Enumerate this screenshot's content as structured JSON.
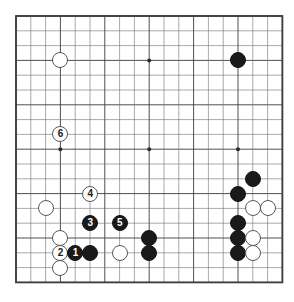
{
  "diagram": {
    "kind": "go-board-diagram",
    "board_size": 19,
    "colors": {
      "background": "#ffffff",
      "grid_line": "#6e6e6e",
      "grid_line_bold": "#3c3c3c",
      "board_border": "#3c3c3c",
      "star_point": "#2b2b2b",
      "black_stone": "#1a1a1a",
      "white_stone": "#ffffff",
      "white_stone_edge": "#585858",
      "black_label_text": "#ffffff",
      "white_label_text": "#1a1a1a"
    },
    "geometry": {
      "origin_x": 16,
      "origin_y": 16,
      "spacing": 14.8,
      "stone_diameter": 16,
      "star_point_radius": 2
    },
    "star_points": [
      {
        "col": 3,
        "row": 3
      },
      {
        "col": 9,
        "row": 3
      },
      {
        "col": 15,
        "row": 3
      },
      {
        "col": 3,
        "row": 9
      },
      {
        "col": 9,
        "row": 9
      },
      {
        "col": 15,
        "row": 9
      },
      {
        "col": 3,
        "row": 15
      },
      {
        "col": 9,
        "row": 15
      },
      {
        "col": 15,
        "row": 15
      }
    ],
    "stones": [
      {
        "color": "white",
        "col": 3,
        "row": 3,
        "label": ""
      },
      {
        "color": "black",
        "col": 15,
        "row": 3,
        "label": ""
      },
      {
        "color": "white",
        "col": 3,
        "row": 8,
        "label": "6"
      },
      {
        "color": "black",
        "col": 16,
        "row": 11,
        "label": ""
      },
      {
        "color": "white",
        "col": 5,
        "row": 12,
        "label": "4"
      },
      {
        "color": "black",
        "col": 15,
        "row": 12,
        "label": ""
      },
      {
        "color": "white",
        "col": 2,
        "row": 13,
        "label": ""
      },
      {
        "color": "white",
        "col": 16,
        "row": 13,
        "label": ""
      },
      {
        "color": "white",
        "col": 17,
        "row": 13,
        "label": ""
      },
      {
        "color": "black",
        "col": 5,
        "row": 14,
        "label": "3"
      },
      {
        "color": "black",
        "col": 7,
        "row": 14,
        "label": "5"
      },
      {
        "color": "black",
        "col": 15,
        "row": 14,
        "label": ""
      },
      {
        "color": "white",
        "col": 3,
        "row": 15,
        "label": ""
      },
      {
        "color": "black",
        "col": 9,
        "row": 15,
        "label": ""
      },
      {
        "color": "black",
        "col": 15,
        "row": 15,
        "label": ""
      },
      {
        "color": "white",
        "col": 16,
        "row": 15,
        "label": ""
      },
      {
        "color": "white",
        "col": 3,
        "row": 16,
        "label": "2"
      },
      {
        "color": "black",
        "col": 4,
        "row": 16,
        "label": "1"
      },
      {
        "color": "black",
        "col": 5,
        "row": 16,
        "label": ""
      },
      {
        "color": "white",
        "col": 7,
        "row": 16,
        "label": ""
      },
      {
        "color": "black",
        "col": 9,
        "row": 16,
        "label": ""
      },
      {
        "color": "black",
        "col": 15,
        "row": 16,
        "label": ""
      },
      {
        "color": "white",
        "col": 16,
        "row": 16,
        "label": ""
      },
      {
        "color": "white",
        "col": 3,
        "row": 17,
        "label": ""
      }
    ],
    "move_numbers": [
      "1",
      "2",
      "3",
      "4",
      "5",
      "6"
    ]
  }
}
